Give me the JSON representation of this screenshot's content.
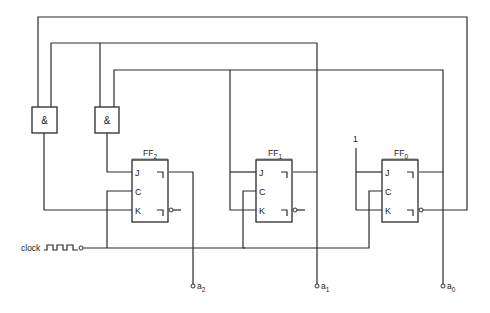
{
  "diagram": {
    "type": "synchronous counter circuit (JK flip-flops)",
    "colors": {
      "line": "#2b2b2b",
      "background": "#ffffff",
      "text": "#222222"
    },
    "gates": [
      {
        "id": "and1",
        "symbol": "&"
      },
      {
        "id": "and2",
        "symbol": "&"
      }
    ],
    "flipflops": [
      {
        "id": "ff2",
        "name": "FF",
        "index": "2",
        "pins": {
          "j": "J",
          "c": "C",
          "k": "K"
        }
      },
      {
        "id": "ff1",
        "name": "FF",
        "index": "1",
        "pins": {
          "j": "J",
          "c": "C",
          "k": "K"
        }
      },
      {
        "id": "ff0",
        "name": "FF",
        "index": "0",
        "pins": {
          "j": "J",
          "c": "C",
          "k": "K"
        }
      }
    ],
    "clock": {
      "label": "clock"
    },
    "constant": {
      "label": "1"
    },
    "outputs": [
      {
        "id": "a2",
        "name": "a",
        "index": "2"
      },
      {
        "id": "a1",
        "name": "a",
        "index": "1"
      },
      {
        "id": "a0",
        "name": "a",
        "index": "0"
      }
    ]
  }
}
